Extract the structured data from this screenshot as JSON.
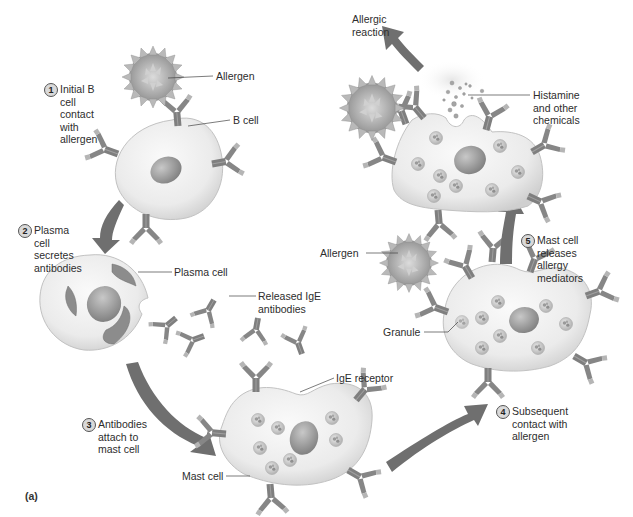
{
  "figure": {
    "panel_label": "(a)",
    "palette": {
      "cell_fill": "#ececec",
      "cell_edge": "#c4c4c4",
      "nucleus": "#9a9a9a",
      "antibody": "#8a8a8a",
      "arrow": "#6f6f6f",
      "allergen": "#a8a8a8",
      "text": "#2d2d2d"
    }
  },
  "steps": [
    {
      "number": "1",
      "text": "Initial B cell\ncontact with\nallergen"
    },
    {
      "number": "2",
      "text": "Plasma cell\nsecretes\nantibodies"
    },
    {
      "number": "3",
      "text": "Antibodies\nattach to\nmast cell"
    },
    {
      "number": "4",
      "text": "Subsequent\ncontact with\nallergen"
    },
    {
      "number": "5",
      "text": "Mast cell releases\nallergy mediators"
    }
  ],
  "labels": {
    "allergen_top": "Allergen",
    "b_cell": "B cell",
    "plasma_cell": "Plasma cell",
    "released_ige": "Released IgE\nantibodies",
    "ige_receptor": "IgE receptor",
    "mast_cell": "Mast cell",
    "granule": "Granule",
    "allergen_mid": "Allergen",
    "histamine": "Histamine\nand other\nchemicals",
    "allergic_reaction": "Allergic\nreaction"
  }
}
